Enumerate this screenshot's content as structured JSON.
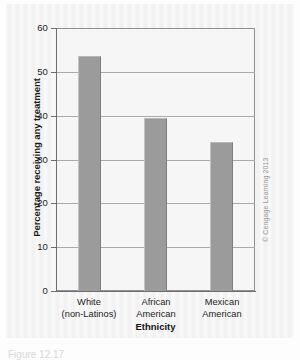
{
  "figure": {
    "credit": "© Cengage Learning 2013",
    "caption_fragment": "Figure 12.17"
  },
  "chart_data": {
    "type": "bar",
    "title": "",
    "categories": [
      "White (non-Latinos)",
      "African American",
      "Mexican American"
    ],
    "category_lines": [
      [
        "White",
        "(non-Latinos)"
      ],
      [
        "African",
        "American"
      ],
      [
        "Mexican",
        "American"
      ]
    ],
    "values": [
      53.5,
      39.5,
      34
    ],
    "xlabel": "Ethnicity",
    "ylabel": "Percentage receiving any treatment",
    "ylim": [
      0,
      60
    ],
    "ytick_labels": [
      "0",
      "10",
      "20",
      "30",
      "40",
      "50",
      "60"
    ],
    "ytick_values": [
      0,
      10,
      20,
      30,
      40,
      50,
      60
    ],
    "grid": "horizontal",
    "legend": "none",
    "bar_color": "#9b9b9b",
    "plot_background": "#f6f6f6",
    "axis_color": "#6e6e6e"
  }
}
